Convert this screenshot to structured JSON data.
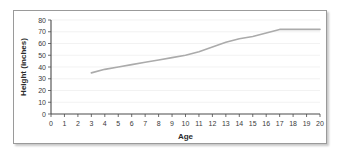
{
  "chart_data": {
    "type": "line",
    "title": "",
    "xlabel": "Age",
    "ylabel": "Height (inches)",
    "xlim": [
      0,
      20
    ],
    "ylim": [
      0,
      80
    ],
    "xticks": [
      0,
      1,
      2,
      3,
      4,
      5,
      6,
      7,
      8,
      9,
      10,
      11,
      12,
      13,
      14,
      15,
      16,
      17,
      18,
      19,
      20
    ],
    "yticks": [
      0,
      10,
      20,
      30,
      40,
      50,
      60,
      70,
      80
    ],
    "xtick_labels": [
      "0",
      "1",
      "2",
      "3",
      "4",
      "5",
      "6",
      "7",
      "8",
      "9",
      "10",
      "11",
      "12",
      "13",
      "14",
      "15",
      "16",
      "17",
      "18",
      "19",
      "20"
    ],
    "ytick_labels": [
      "0",
      "10",
      "20",
      "30",
      "40",
      "50",
      "60",
      "70",
      "80"
    ],
    "grid": "horizontal",
    "legend": "none",
    "line_color": "#ababab",
    "axis_color": "#4a4a4a",
    "grid_color": "#ededed",
    "x": [
      3,
      4,
      5,
      6,
      7,
      8,
      9,
      10,
      11,
      12,
      13,
      14,
      15,
      16,
      17,
      18,
      19,
      20
    ],
    "series": [
      {
        "name": "Height",
        "values": [
          35,
          38,
          40,
          42,
          44,
          46,
          48,
          50,
          53,
          57,
          61,
          64,
          66,
          69,
          72,
          72,
          72,
          72
        ]
      }
    ]
  },
  "figure": {
    "border_color": "#9a9a9a",
    "background": "#ffffff"
  }
}
